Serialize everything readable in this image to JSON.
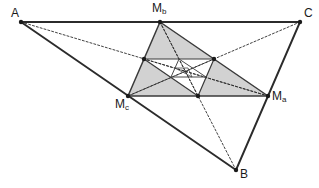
{
  "figure": {
    "width": 319,
    "height": 188,
    "background_color": "#ffffff"
  },
  "style": {
    "outline_color": "#2b2b2b",
    "outline_width": 1.9,
    "medial_stroke_color": "#3a3a3a",
    "medial_stroke_width": 1.5,
    "inner_stroke_color": "#4a4a4a",
    "inner_stroke_width": 1.0,
    "dotted_color": "#2b2b2b",
    "dotted_width": 0.9,
    "dash_pattern": "2,2",
    "vertex_dot_color": "#1a1a1a",
    "vertex_dot_radius": 2.2,
    "fill_level_1": "#d2d2d2",
    "fill_level_2": "#bdbdbd",
    "fill_level_3": "#a8a8a8",
    "fill_level_4": "#949494",
    "fill_none": "none"
  },
  "labels": [
    {
      "id": "A",
      "text": "A",
      "sub": "",
      "x": 11,
      "y": 7,
      "name": "vertex-label-a"
    },
    {
      "id": "B",
      "text": "B",
      "sub": "",
      "x": 240,
      "y": 168,
      "name": "vertex-label-b"
    },
    {
      "id": "C",
      "text": "C",
      "sub": "",
      "x": 304,
      "y": 7,
      "name": "vertex-label-c"
    },
    {
      "id": "Ma",
      "text": "M",
      "sub": "a",
      "x": 272,
      "y": 90,
      "name": "vertex-label-ma"
    },
    {
      "id": "Mb",
      "text": "M",
      "sub": "b",
      "x": 152,
      "y": 2,
      "name": "vertex-label-mb"
    },
    {
      "id": "Mc",
      "text": "M",
      "sub": "c",
      "x": 115,
      "y": 98,
      "name": "vertex-label-mc"
    }
  ],
  "points": {
    "A": {
      "x": 21,
      "y": 22
    },
    "B": {
      "x": 236,
      "y": 170
    },
    "C": {
      "x": 300,
      "y": 22
    },
    "Ma": {
      "x": 268,
      "y": 96
    },
    "Mb": {
      "x": 160,
      "y": 22
    },
    "Mc": {
      "x": 128,
      "y": 96
    },
    "L2a": {
      "x": 214,
      "y": 59
    },
    "L2b": {
      "x": 198,
      "y": 96
    },
    "L2c": {
      "x": 144,
      "y": 59
    },
    "L3a": {
      "x": 206,
      "y": 77
    },
    "L3b": {
      "x": 171,
      "y": 77
    },
    "L3c": {
      "x": 179,
      "y": 59
    },
    "L4a": {
      "x": 188,
      "y": 68
    },
    "L4b": {
      "x": 175,
      "y": 68
    },
    "L4c": {
      "x": 192,
      "y": 77
    }
  },
  "shapes": {
    "outer_triangle": {
      "name": "outer-triangle-abc",
      "vertices": [
        "A",
        "B",
        "C"
      ],
      "fill": "none",
      "stroke": "#2b2b2b",
      "stroke_width": 1.9
    },
    "medial_triangle_1": {
      "name": "medial-triangle-level-1",
      "vertices": [
        "Ma",
        "Mb",
        "Mc"
      ],
      "fill": "#d2d2d2",
      "stroke": "#3a3a3a",
      "stroke_width": 1.5
    },
    "medial_triangle_2": {
      "name": "medial-triangle-level-2",
      "vertices": [
        "L2a",
        "L2b",
        "L2c"
      ],
      "fill": "#ffffff",
      "stroke": "#3a3a3a",
      "stroke_width": 1.2
    },
    "medial_triangle_3": {
      "name": "medial-triangle-level-3",
      "vertices": [
        "L3a",
        "L3b",
        "L3c"
      ],
      "fill": "#bdbdbd",
      "stroke": "#4a4a4a",
      "stroke_width": 1.0
    },
    "medial_triangle_4": {
      "name": "medial-triangle-level-4",
      "vertices": [
        "L4a",
        "L4b",
        "L4c"
      ],
      "fill": "#ffffff",
      "stroke": "#4a4a4a",
      "stroke_width": 0.8
    }
  },
  "medians": [
    {
      "name": "median-a-to-ma",
      "from": "A",
      "to": "Ma"
    },
    {
      "name": "median-b-to-mb",
      "from": "B",
      "to": "Mb"
    },
    {
      "name": "median-c-to-mc",
      "from": "C",
      "to": "Mc"
    },
    {
      "name": "median-ma-to-l2",
      "from": "Ma",
      "to": "L2c"
    },
    {
      "name": "median-mb-to-l2",
      "from": "Mb",
      "to": "L2b"
    },
    {
      "name": "median-mc-to-l2",
      "from": "Mc",
      "to": "L2a"
    }
  ],
  "vertex_dots": [
    "A",
    "B",
    "C",
    "Ma",
    "Mb",
    "Mc",
    "L2a",
    "L2b",
    "L2c"
  ]
}
